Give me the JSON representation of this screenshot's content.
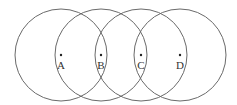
{
  "diagram": {
    "type": "overlapping-circles",
    "points": [
      {
        "id": "A",
        "label": "A"
      },
      {
        "id": "B",
        "label": "B"
      },
      {
        "id": "C",
        "label": "C"
      },
      {
        "id": "D",
        "label": "D"
      }
    ],
    "colors": {
      "stroke": "#6a6a6a",
      "dot": "#222222",
      "label": "#333333",
      "background": "#ffffff"
    }
  }
}
